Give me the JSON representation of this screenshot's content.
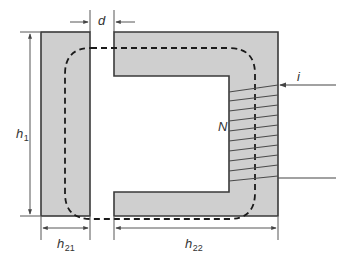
{
  "diagram": {
    "colors": {
      "core_fill": "#cfcfcf",
      "core_stroke": "#3a3a3a",
      "flux_path": "#1a1a1a",
      "dimension_lines": "#444444",
      "coil": "#4a4a4a",
      "background": "#ffffff"
    },
    "components": {
      "left_bar": {
        "label": "I-shaped yoke",
        "x": 41,
        "y": 32,
        "width": 49,
        "height": 184
      },
      "c_core": {
        "label": "C-shaped core",
        "outer": {
          "x": 114,
          "y": 32,
          "width": 164,
          "height": 184
        },
        "window": {
          "x": 114,
          "y": 76,
          "width": 115,
          "height": 116
        }
      },
      "flux_path": {
        "style": "dashed",
        "left": 65,
        "right": 255,
        "top": 48,
        "bottom": 219,
        "radius": 26
      },
      "coil": {
        "turns_drawn": 9,
        "leg_x1": 229,
        "leg_x2": 278,
        "top_y": 112,
        "bottom_y": 178
      },
      "terminals": {
        "input": {
          "y": 85,
          "x_start": 336,
          "x_end": 278,
          "direction": "arrow into core"
        },
        "output": {
          "y": 178,
          "x_start": 278,
          "x_end": 336
        }
      }
    },
    "labels": {
      "gap": "d",
      "height": "h",
      "height_sub": "1",
      "left_width": "h",
      "left_width_sub": "21",
      "right_width": "h",
      "right_width_sub": "22",
      "turns": "N",
      "current": "i"
    }
  }
}
